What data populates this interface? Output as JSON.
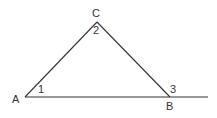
{
  "diagram": {
    "type": "triangle with extended base",
    "colors": {
      "line": "#333333",
      "background": "#ffffff"
    },
    "points": {
      "A": {
        "x": 25,
        "y": 97
      },
      "B": {
        "x": 170,
        "y": 97
      },
      "C": {
        "x": 97,
        "y": 22
      },
      "extension_end": {
        "x": 208,
        "y": 97
      }
    },
    "vertex_labels": {
      "A": "A",
      "B": "B",
      "C": "C"
    },
    "angle_labels": {
      "angle1": "1",
      "angle2": "2",
      "angle3": "3"
    }
  }
}
